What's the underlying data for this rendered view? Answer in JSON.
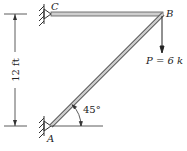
{
  "diagram": {
    "nodes": {
      "A": {
        "label": "A",
        "support": "pin-wall"
      },
      "B": {
        "label": "B",
        "support": "none"
      },
      "C": {
        "label": "C",
        "support": "pin-wall"
      }
    },
    "members": [
      {
        "from": "C",
        "to": "B",
        "orientation": "horizontal"
      },
      {
        "from": "A",
        "to": "B",
        "orientation": "diagonal"
      }
    ],
    "dimension": {
      "label": "12 ft",
      "between": [
        "C",
        "A"
      ],
      "orientation": "vertical"
    },
    "angle": {
      "label": "45°",
      "at": "A"
    },
    "load": {
      "label": "P = 6 k",
      "at": "B",
      "direction": "down"
    },
    "colors": {
      "member_fill": "#cfcfcf",
      "member_edge": "#555555",
      "line": "#222222"
    }
  }
}
